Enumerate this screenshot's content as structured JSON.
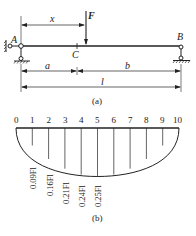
{
  "figure_a": {
    "caption": "(a)",
    "support_left_label": "A",
    "support_right_label": "B",
    "load_label": "F",
    "point_label": "C",
    "dimension_x": "x",
    "dimension_a": "a",
    "dimension_b": "b",
    "dimension_l": "l"
  },
  "figure_b": {
    "caption": "(b)",
    "ticks": [
      "0",
      "1",
      "2",
      "3",
      "4",
      "5",
      "6",
      "7",
      "8",
      "9",
      "10"
    ],
    "ordinates": [
      0,
      0.09,
      0.16,
      0.21,
      0.24,
      0.25,
      0.24,
      0.21,
      0.16,
      0.09,
      0
    ],
    "value_labels": [
      "0.09Fl",
      "0.16Fl",
      "0.21Fl",
      "0.24Fl",
      "0.25Fl"
    ]
  },
  "colors": {
    "line": "#222222",
    "background": "#ffffff"
  }
}
